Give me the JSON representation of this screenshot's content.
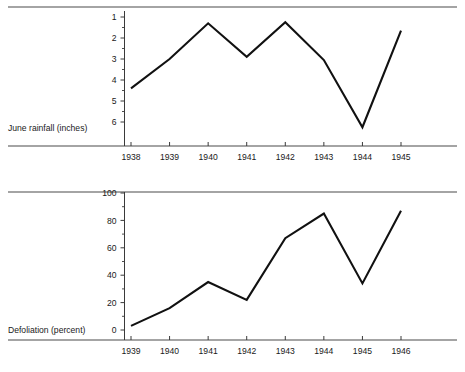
{
  "document": {
    "kind": "two-panel-line-chart-figure",
    "background_color": "#ffffff",
    "ink_color": "#111111",
    "rule_color": "#4a4a4a"
  },
  "panels": [
    {
      "id": "rainfall",
      "axis_caption": "June rainfall (inches)",
      "y_tick_labels": [
        "1",
        "2",
        "3",
        "4",
        "5",
        "6"
      ],
      "x_tick_labels": [
        "1938",
        "1939",
        "1940",
        "1941",
        "1942",
        "1943",
        "1944",
        "1945"
      ]
    },
    {
      "id": "defoliation",
      "axis_caption": "Defoliation (percent)",
      "y_tick_labels": [
        "0",
        "20",
        "40",
        "60",
        "80",
        "100"
      ],
      "x_tick_labels": [
        "1939",
        "1940",
        "1941",
        "1942",
        "1943",
        "1944",
        "1945",
        "1946"
      ]
    }
  ],
  "chart_data": [
    {
      "type": "line",
      "title": "",
      "xlabel": "",
      "ylabel": "June rainfall (inches)",
      "categories": [
        "1938",
        "1939",
        "1940",
        "1941",
        "1942",
        "1943",
        "1944",
        "1945"
      ],
      "x": [
        1938,
        1939,
        1940,
        1941,
        1942,
        1943,
        1944,
        1945
      ],
      "values": [
        4.4,
        3.0,
        1.3,
        2.9,
        1.25,
        3.05,
        6.25,
        1.65
      ],
      "ylim": [
        1,
        6.6
      ],
      "y_inverted": true,
      "y_ticks": [
        1,
        2,
        3,
        4,
        5,
        6
      ],
      "y_minor_ticks": [
        1.5,
        2.5,
        3.5,
        4.5,
        5.5
      ],
      "grid": false,
      "legend": null,
      "legend_position": "none",
      "line_color": "#111111"
    },
    {
      "type": "line",
      "title": "",
      "xlabel": "",
      "ylabel": "Defoliation (percent)",
      "categories": [
        "1939",
        "1940",
        "1941",
        "1942",
        "1943",
        "1944",
        "1945",
        "1946"
      ],
      "x": [
        1939,
        1940,
        1941,
        1942,
        1943,
        1944,
        1945,
        1946
      ],
      "values": [
        3,
        16,
        35,
        22,
        67,
        85,
        34,
        87
      ],
      "ylim": [
        0,
        105
      ],
      "y_inverted": false,
      "y_ticks": [
        0,
        20,
        40,
        60,
        80,
        100
      ],
      "y_minor_ticks": [
        10,
        30,
        50,
        70,
        90
      ],
      "grid": false,
      "legend": null,
      "legend_position": "none",
      "line_color": "#111111"
    }
  ]
}
